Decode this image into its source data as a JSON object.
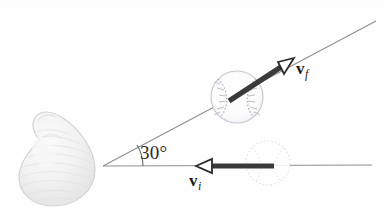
{
  "figure": {
    "background_color": "#fefefe",
    "width": 384,
    "height": 224
  },
  "labels": {
    "angle": "30°",
    "final_velocity": {
      "symbol": "v",
      "subscript": "f"
    },
    "initial_velocity": {
      "symbol": "v",
      "subscript": "i"
    }
  },
  "colors": {
    "arrow": "#3a3a3a",
    "arrow_outline": "#2b2b2b",
    "guide_line": "#8f8f8f",
    "ball_outgoing": "#b9b9c2",
    "ball_incoming": "#dcdce2",
    "bat_fill": "#efefef",
    "bat_outline": "#d2d2d2",
    "text": "#1c1c1c"
  },
  "geometry": {
    "vertex": {
      "x": 103,
      "y": 166
    },
    "horizontal_line": {
      "x1": 103,
      "y1": 166,
      "x2": 372,
      "y2": 165
    },
    "diagonal_line": {
      "x1": 103,
      "y1": 166,
      "x2": 376,
      "y2": 21
    },
    "angle_arc": {
      "cx": 103,
      "cy": 166,
      "radius": 40
    },
    "ball_outgoing": {
      "cx": 237,
      "cy": 97,
      "r": 26
    },
    "ball_incoming": {
      "cx": 268,
      "cy": 163,
      "r": 22
    },
    "arrow_final": {
      "x1": 229,
      "y1": 101,
      "x2": 290,
      "y2": 61
    },
    "arrow_initial": {
      "x1": 272,
      "y1": 166,
      "x2": 198,
      "y2": 166
    },
    "bat": {
      "cx": 56,
      "cy": 165,
      "rx": 38,
      "ry": 45
    }
  },
  "icons": {
    "ball_outgoing": "baseball-icon",
    "ball_incoming": "baseball-ghost-icon",
    "bat": "baseball-bat-icon",
    "arrow_final": "vector-arrow-icon",
    "arrow_initial": "vector-arrow-icon",
    "angle_arc": "angle-arc-icon"
  }
}
